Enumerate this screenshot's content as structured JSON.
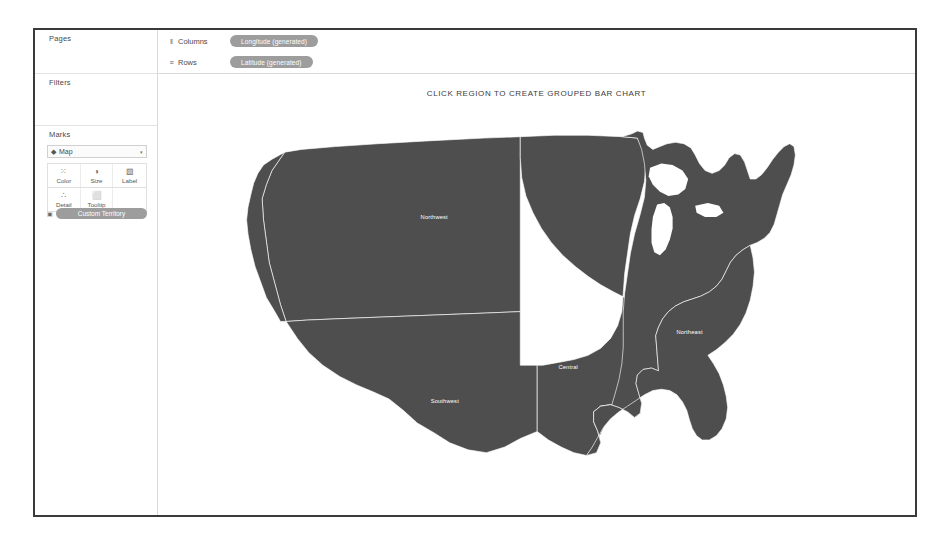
{
  "window": {
    "app": "Tableau Worksheet"
  },
  "left_panel": {
    "pages": {
      "label": "Pages"
    },
    "filters": {
      "label": "Filters"
    },
    "marks": {
      "label": "Marks",
      "type_selector": {
        "icon": "map-mark-icon",
        "value": "Map",
        "caret": "▾"
      },
      "buttons": [
        {
          "name": "color",
          "label": "Color",
          "icon": "⁙"
        },
        {
          "name": "size",
          "label": "Size",
          "icon": "◑"
        },
        {
          "name": "label",
          "label": "Label",
          "icon": "▧"
        },
        {
          "name": "detail",
          "label": "Detail",
          "icon": "∴"
        },
        {
          "name": "tooltip",
          "label": "Tooltip",
          "icon": "⬜"
        }
      ],
      "territory_pill": {
        "icon": "shape-icon",
        "label": "Custom Territory"
      }
    }
  },
  "top_shelves": {
    "columns": {
      "icon": "‖",
      "label": "Columns",
      "pill": "Longitude (generated)"
    },
    "rows": {
      "icon": "≡",
      "label": "Rows",
      "pill": "Latitude (generated)"
    }
  },
  "viz": {
    "title": "CLICK REGION TO CREATE GROUPED BAR CHART",
    "map": {
      "type": "choropleth-territory-map",
      "region": "United States (contiguous)",
      "fill_color": "#4e4e4e",
      "border_color": "#ffffff",
      "label_color": "#ffffff",
      "territories": [
        {
          "id": "northwest",
          "label": "Northwest",
          "label_x": 330,
          "label_y": 168
        },
        {
          "id": "southwest",
          "label": "Southwest",
          "label_x": 345,
          "label_y": 430
        },
        {
          "id": "central",
          "label": "Central",
          "label_x": 520,
          "label_y": 382
        },
        {
          "id": "northeast",
          "label": "Northeast",
          "label_x": 692,
          "label_y": 332
        },
        {
          "id": "southeast",
          "label": "Southeast",
          "label_x": 661,
          "label_y": 475
        }
      ]
    }
  }
}
